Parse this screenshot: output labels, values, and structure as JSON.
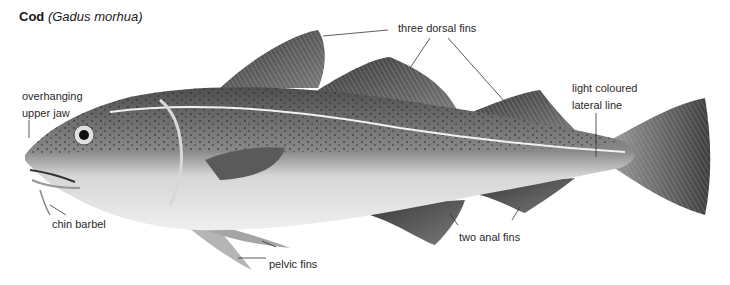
{
  "title": {
    "common_name": "Cod",
    "scientific_name": "(Gadus morhua)"
  },
  "labels": {
    "dorsal_fins": "three dorsal fins",
    "upper_jaw_line1": "overhanging",
    "upper_jaw_line2": "upper jaw",
    "lateral_line_line1": "light coloured",
    "lateral_line_line2": "lateral line",
    "chin_barbel": "chin barbel",
    "pelvic_fins": "pelvic fins",
    "anal_fins": "two anal fins"
  },
  "illustration": {
    "subject": "cod-fish",
    "colors": {
      "back": "#5a5a5a",
      "belly": "#e8e8e8",
      "fin": "#4a4a4a",
      "lateral_line": "#f4f4f4",
      "leader": "#333333"
    }
  }
}
